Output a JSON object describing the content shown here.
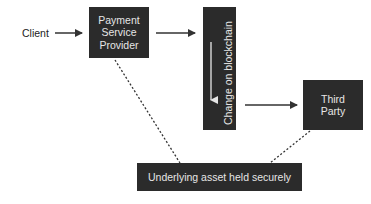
{
  "diagram": {
    "nodes": {
      "client": {
        "label": "Client"
      },
      "psp": {
        "line1": "Payment",
        "line2": "Service",
        "line3": "Provider"
      },
      "blockchain": {
        "label": "Change on blockchain"
      },
      "third_party": {
        "line1": "Third",
        "line2": "Party"
      },
      "asset": {
        "label": "Underlying asset held securely"
      }
    },
    "edges": [
      {
        "from": "client",
        "to": "psp",
        "style": "solid-arrow"
      },
      {
        "from": "psp",
        "to": "blockchain",
        "style": "solid-arrow"
      },
      {
        "from": "blockchain",
        "to": "third_party",
        "style": "solid-arrow"
      },
      {
        "from": "psp",
        "to": "asset",
        "style": "dotted"
      },
      {
        "from": "third_party",
        "to": "asset",
        "style": "dotted"
      }
    ],
    "colors": {
      "box_fill": "#2b2b2b",
      "box_text": "#e6e6e6",
      "line": "#333333",
      "background": "#ffffff"
    }
  }
}
